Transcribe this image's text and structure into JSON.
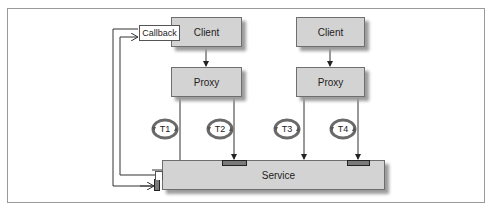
{
  "diagram": {
    "clients": [
      {
        "label": "Client"
      },
      {
        "label": "Client"
      }
    ],
    "proxies": [
      {
        "label": "Proxy"
      },
      {
        "label": "Proxy"
      }
    ],
    "callback": {
      "label": "Callback"
    },
    "service": {
      "label": "Service"
    },
    "threads": [
      {
        "label": "T1"
      },
      {
        "label": "T2"
      },
      {
        "label": "T3"
      },
      {
        "label": "T4"
      }
    ],
    "colors": {
      "box_fill": "#d3d3d3",
      "box_border": "#6e6e6e",
      "port_fill": "#7a7a7a",
      "line": "#333333",
      "thread_ring": "#6a6a6a"
    }
  }
}
